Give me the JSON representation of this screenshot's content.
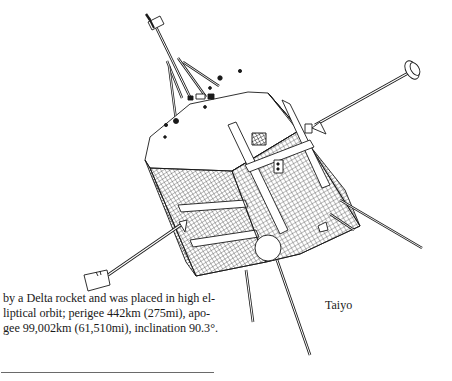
{
  "figure": {
    "caption": "Taiyo",
    "icons": {
      "satellite": "satellite-illustration-icon"
    }
  },
  "article": {
    "lines": [
      "by a Delta rocket and was placed in high el-",
      "liptical orbit; perigee 442km (275mi), apo-",
      "gee 99,002km (61,510mi), inclination 90.3°."
    ]
  },
  "colors": {
    "ink": "#1a1a1a",
    "background": "#ffffff",
    "rule": "#6a6a6a"
  }
}
